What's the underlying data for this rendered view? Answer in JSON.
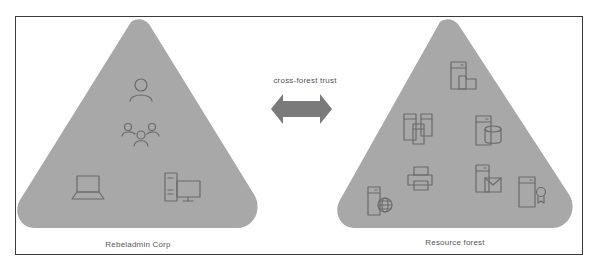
{
  "diagram": {
    "left_forest": {
      "label": "Rebeladmin Corp",
      "icons": [
        "user-icon",
        "group-icon",
        "laptop-icon",
        "desktop-computer-icon"
      ]
    },
    "right_forest": {
      "label": "Resource forest",
      "icons": [
        "file-server-icon",
        "server-cluster-icon",
        "database-server-icon",
        "printer-icon",
        "mail-server-icon",
        "certificate-server-icon",
        "web-server-icon"
      ]
    },
    "connector": {
      "label": "cross-forest trust",
      "type": "bidirectional-arrow"
    },
    "colors": {
      "triangle_fill": "#a8a8a8",
      "arrow_fill": "#7a7a7a",
      "icon_stroke": "#6b6b6b",
      "frame_border": "#3a3a3a"
    }
  }
}
